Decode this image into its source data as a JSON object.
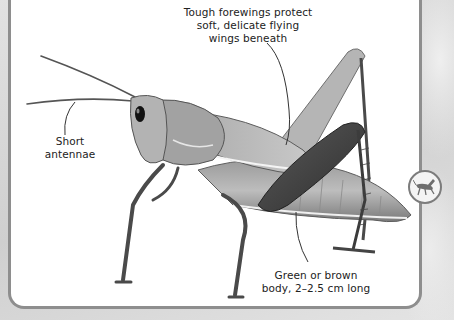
{
  "figure": {
    "annotations": [
      {
        "id": "forewings",
        "lines": [
          "Tough forewings protect",
          "soft, delicate flying",
          "wings beneath"
        ]
      },
      {
        "id": "antennae",
        "lines": [
          "Short",
          "antennae"
        ]
      },
      {
        "id": "body",
        "lines": [
          "Green or brown",
          "body, 2–2.5 cm long"
        ]
      }
    ]
  },
  "badge": {
    "icon": "grasshopper-icon"
  },
  "colors": {
    "panel_bg": "#ffffff",
    "panel_border": "#8e8e8e",
    "page_bg": "#d9d9d9",
    "text": "#222222"
  }
}
